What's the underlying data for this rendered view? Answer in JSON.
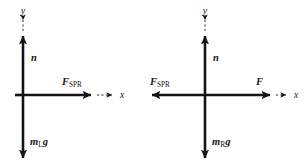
{
  "figure": {
    "stroke_color": "#141414",
    "background_color": "#ffffff",
    "diagrams": [
      {
        "id": "left-block",
        "name": "free-body-diagram-left",
        "origin": {
          "x": 23,
          "y": 95
        },
        "axes": {
          "y_label": "y",
          "x_label": "x",
          "y_label_pos": {
            "x": 23,
            "y": 14
          },
          "x_label_pos": {
            "x": 123,
            "y": 98
          }
        },
        "vectors": [
          {
            "name": "normal-force",
            "label": "n",
            "label_plain": "n",
            "direction": "up",
            "tip": {
              "x": 23,
              "y": 34
            },
            "label_pos": {
              "x": 31,
              "y": 60
            }
          },
          {
            "name": "spring-force",
            "label": "F",
            "subscript": "SPR",
            "label_plain": "F_SPR",
            "direction": "right",
            "tip": {
              "x": 93,
              "y": 95
            },
            "label_pos": {
              "x": 62,
              "y": 84
            }
          },
          {
            "name": "weight-force",
            "label": "m",
            "subscript": "L",
            "label_tail": "g",
            "label_plain": "m_L g",
            "direction": "down",
            "tip": {
              "x": 23,
              "y": 160
            },
            "label_pos": {
              "x": 30,
              "y": 144
            }
          }
        ]
      },
      {
        "id": "right-block",
        "name": "free-body-diagram-right",
        "origin": {
          "x": 205,
          "y": 95
        },
        "axes": {
          "y_label": "y",
          "x_label": "x",
          "y_label_pos": {
            "x": 205,
            "y": 14
          },
          "x_label_pos": {
            "x": 296,
            "y": 98
          }
        },
        "vectors": [
          {
            "name": "normal-force",
            "label": "n",
            "label_plain": "n",
            "direction": "up",
            "tip": {
              "x": 205,
              "y": 34
            },
            "label_pos": {
              "x": 213,
              "y": 60
            }
          },
          {
            "name": "spring-force",
            "label": "F",
            "subscript": "SPR",
            "label_plain": "F_SPR",
            "direction": "left",
            "tip": {
              "x": 150,
              "y": 95
            },
            "label_pos": {
              "x": 150,
              "y": 84
            }
          },
          {
            "name": "applied-force",
            "label": "F",
            "label_plain": "F",
            "direction": "right",
            "tip": {
              "x": 272,
              "y": 95
            },
            "label_pos": {
              "x": 256,
              "y": 84
            }
          },
          {
            "name": "weight-force",
            "label": "m",
            "subscript": "R",
            "label_tail": "g",
            "label_plain": "m_R g",
            "direction": "down",
            "tip": {
              "x": 205,
              "y": 160
            },
            "label_pos": {
              "x": 212,
              "y": 144
            }
          }
        ]
      }
    ]
  }
}
